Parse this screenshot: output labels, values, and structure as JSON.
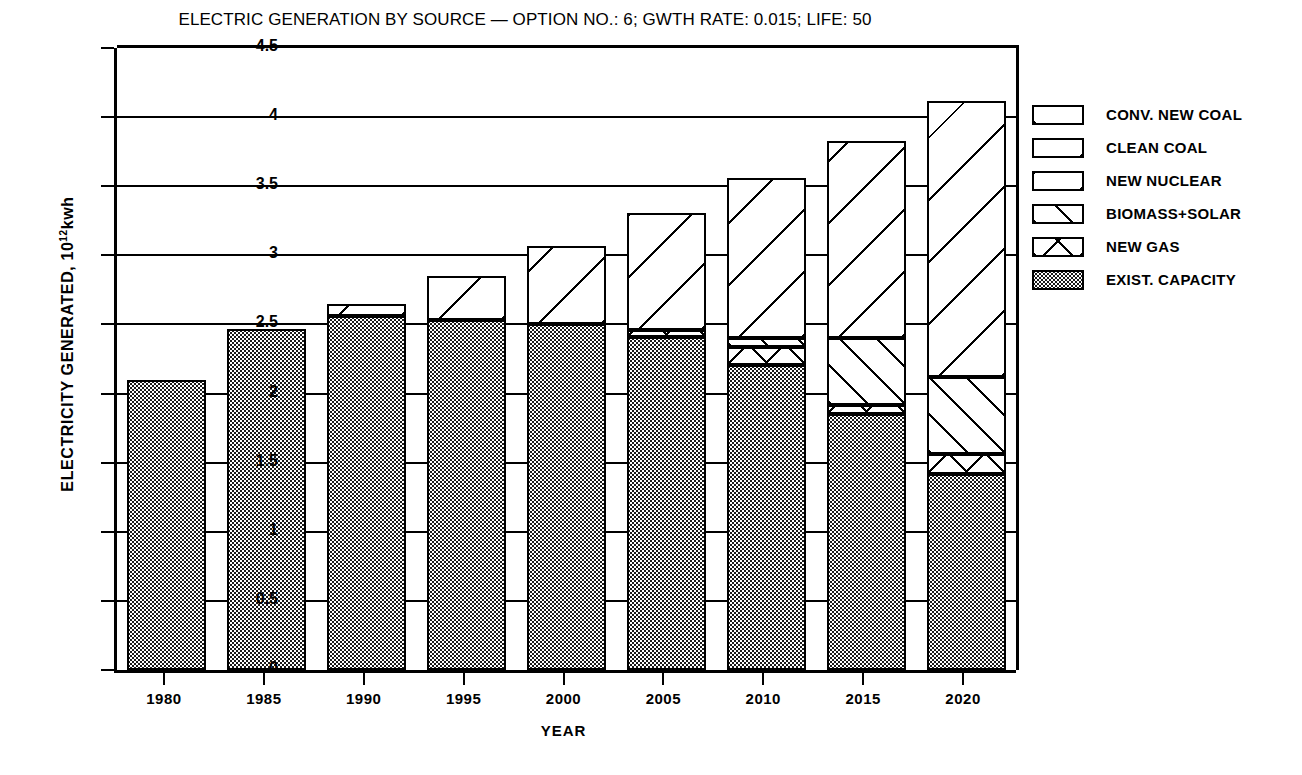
{
  "chart_data": {
    "type": "bar",
    "subtype": "stacked",
    "title": "ELECTRIC GENERATION BY SOURCE — OPTION NO.: 6; GWTH RATE: 0.015; LIFE: 50",
    "xlabel": "YEAR",
    "ylabel_prefix": "ELECTRICITY GENERATED, 10",
    "ylabel_exponent": "12",
    "ylabel_unit": "kwh",
    "ylabel_full": "ELECTRICITY GENERATED, 10^12 kwh",
    "categories": [
      "1980",
      "1985",
      "1990",
      "1995",
      "2000",
      "2005",
      "2010",
      "2015",
      "2020"
    ],
    "ylim": [
      0,
      4.5
    ],
    "ytick_labels": [
      "0",
      "0.5",
      "1",
      "1.5",
      "2",
      "2.5",
      "3",
      "3.5",
      "4",
      "4.5"
    ],
    "ytick_values": [
      0,
      0.5,
      1,
      1.5,
      2,
      2.5,
      3,
      3.5,
      4,
      4.5
    ],
    "grid": "horizontal",
    "legend_position": "right",
    "series": [
      {
        "name": "EXIST. CAPACITY",
        "pattern": "stipple",
        "values": [
          2.1,
          2.47,
          2.56,
          2.53,
          2.5,
          2.41,
          2.21,
          1.85,
          1.42
        ]
      },
      {
        "name": "NEW GAS",
        "pattern": "cross-hatch",
        "values": [
          0,
          0,
          0,
          0,
          0,
          0.05,
          0.13,
          0.07,
          0.14
        ]
      },
      {
        "name": "BIOMASS+SOLAR",
        "pattern": "diagonal-up",
        "values": [
          0,
          0,
          0,
          0,
          0,
          0,
          0.06,
          0.48,
          0.56
        ]
      },
      {
        "name": "NEW NUCLEAR",
        "pattern": "diagonal-down",
        "values": [
          0,
          0,
          0.09,
          0.32,
          0.57,
          0.85,
          1.16,
          1.43,
          2.0
        ]
      },
      {
        "name": "CLEAN COAL",
        "pattern": "sparse-diagonal-down",
        "values": [
          0,
          0,
          0,
          0,
          0,
          0,
          0,
          0,
          0
        ]
      },
      {
        "name": "CONV. NEW COAL",
        "pattern": "sparse-diagonal-up",
        "values": [
          0,
          0,
          0,
          0,
          0,
          0,
          0,
          0,
          0
        ]
      }
    ],
    "totals": [
      2.1,
      2.47,
      2.65,
      2.85,
      3.07,
      3.31,
      3.56,
      3.83,
      4.12
    ]
  },
  "legend": {
    "items": [
      {
        "label": "CONV. NEW COAL",
        "swatch": "fill-convcoal"
      },
      {
        "label": "CLEAN COAL",
        "swatch": "fill-cleancoal"
      },
      {
        "label": "NEW NUCLEAR",
        "swatch": "fill-nuclear"
      },
      {
        "label": "BIOMASS+SOLAR",
        "swatch": "fill-biomass"
      },
      {
        "label": "NEW GAS",
        "swatch": "fill-newgas"
      },
      {
        "label": "EXIST. CAPACITY",
        "swatch": "fill-exist"
      }
    ]
  }
}
